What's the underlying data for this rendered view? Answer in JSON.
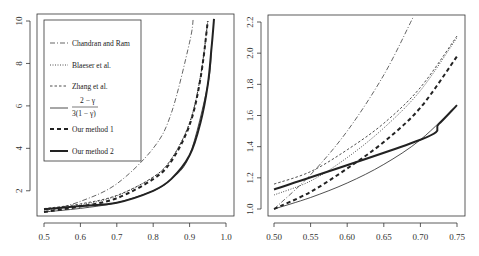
{
  "chart_data": [
    {
      "type": "line",
      "panel": "left",
      "title": "",
      "xlabel": "",
      "ylabel": "",
      "xlim": [
        0.5,
        1.0
      ],
      "ylim": [
        1.0,
        10.0
      ],
      "x_ticks": [
        0.5,
        0.6,
        0.7,
        0.8,
        0.9,
        1.0
      ],
      "x_tick_labels": [
        "0.5",
        "0.6",
        "0.7",
        "0.8",
        "0.9",
        "1.0"
      ],
      "y_ticks": [
        2,
        4,
        6,
        8,
        10
      ],
      "y_tick_labels": [
        "2",
        "4",
        "6",
        "8",
        "10"
      ],
      "grid": false,
      "legend_position": "top-left",
      "series": [
        {
          "name": "Chandran and Ram",
          "style": "dash-dot",
          "x": [
            0.5,
            0.6,
            0.7,
            0.8,
            0.85,
            0.9,
            0.91
          ],
          "y": [
            1.0,
            1.5,
            2.33,
            4.0,
            5.67,
            9.0,
            10.1
          ]
        },
        {
          "name": "Blaeser et al.",
          "style": "dotted",
          "x": [
            0.5,
            0.6,
            0.7,
            0.8,
            0.85,
            0.9,
            0.93,
            0.95
          ],
          "y": [
            1.09,
            1.33,
            1.76,
            2.64,
            3.5,
            5.2,
            7.4,
            10.0
          ]
        },
        {
          "name": "Zhang et al.",
          "style": "dashed-thin",
          "x": [
            0.5,
            0.6,
            0.7,
            0.8,
            0.85,
            0.9,
            0.93,
            0.95
          ],
          "y": [
            1.16,
            1.38,
            1.78,
            2.65,
            3.5,
            5.2,
            7.4,
            10.0
          ]
        },
        {
          "name": "(2-γ)/(3(1-γ))",
          "style": "solid-thin",
          "x": [
            0.5,
            0.6,
            0.7,
            0.8,
            0.85,
            0.9,
            0.95,
            0.96
          ],
          "y": [
            1.0,
            1.17,
            1.44,
            2.0,
            2.56,
            3.67,
            7.0,
            8.67
          ]
        },
        {
          "name": "Our method 1",
          "style": "dashed-thick",
          "x": [
            0.5,
            0.6,
            0.7,
            0.8,
            0.85,
            0.9,
            0.93,
            0.95
          ],
          "y": [
            1.0,
            1.26,
            1.65,
            2.55,
            3.4,
            5.1,
            7.3,
            10.0
          ]
        },
        {
          "name": "Our method 2",
          "style": "solid-thick",
          "x": [
            0.5,
            0.6,
            0.7,
            0.8,
            0.85,
            0.9,
            0.93,
            0.95,
            0.96,
            0.967
          ],
          "y": [
            1.125,
            1.28,
            1.44,
            2.0,
            2.56,
            3.67,
            5.22,
            7.0,
            8.67,
            10.1
          ]
        }
      ]
    },
    {
      "type": "line",
      "panel": "right",
      "title": "",
      "xlabel": "",
      "ylabel": "",
      "xlim": [
        0.5,
        0.75
      ],
      "ylim": [
        1.0,
        2.2
      ],
      "x_ticks": [
        0.5,
        0.55,
        0.6,
        0.65,
        0.7,
        0.75
      ],
      "x_tick_labels": [
        "0.50",
        "0.55",
        "0.60",
        "0.65",
        "0.70",
        "0.75"
      ],
      "y_ticks": [
        1.0,
        1.2,
        1.4,
        1.6,
        1.8,
        2.0,
        2.2
      ],
      "y_tick_labels": [
        "1.0",
        "1.2",
        "1.4",
        "1.6",
        "1.8",
        "2.0",
        "2.2"
      ],
      "grid": false,
      "legend_position": "none",
      "series": [
        {
          "name": "Chandran and Ram",
          "style": "dash-dot",
          "x": [
            0.5,
            0.55,
            0.6,
            0.65,
            0.69
          ],
          "y": [
            1.0,
            1.22,
            1.5,
            1.86,
            2.23
          ]
        },
        {
          "name": "Blaeser et al.",
          "style": "dotted",
          "x": [
            0.5,
            0.55,
            0.6,
            0.65,
            0.7,
            0.75
          ],
          "y": [
            1.09,
            1.18,
            1.33,
            1.52,
            1.76,
            2.1
          ]
        },
        {
          "name": "Zhang et al.",
          "style": "dashed-thin",
          "x": [
            0.5,
            0.55,
            0.6,
            0.65,
            0.7,
            0.75
          ],
          "y": [
            1.16,
            1.24,
            1.38,
            1.55,
            1.78,
            2.11
          ]
        },
        {
          "name": "(2-γ)/(3(1-γ))",
          "style": "solid-thin",
          "x": [
            0.5,
            0.55,
            0.6,
            0.65,
            0.7,
            0.75
          ],
          "y": [
            1.0,
            1.074,
            1.167,
            1.286,
            1.444,
            1.667
          ]
        },
        {
          "name": "Our method 1",
          "style": "dashed-thick",
          "x": [
            0.5,
            0.55,
            0.6,
            0.65,
            0.7,
            0.75
          ],
          "y": [
            1.0,
            1.11,
            1.26,
            1.43,
            1.65,
            1.98
          ]
        },
        {
          "name": "Our method 2",
          "style": "solid-thick",
          "x": [
            0.5,
            0.7,
            0.725,
            0.75
          ],
          "y": [
            1.125,
            1.444,
            1.545,
            1.667
          ]
        }
      ]
    }
  ],
  "legend": {
    "items": [
      {
        "label": "Chandran and Ram",
        "style": "dash-dot"
      },
      {
        "label": "Blaeser et al.",
        "style": "dotted"
      },
      {
        "label": "Zhang et al.",
        "style": "dashed-thin"
      },
      {
        "label_num": "2 − γ",
        "label_den": "3(1 − γ)",
        "style": "solid-thin"
      },
      {
        "label": "Our method 1",
        "style": "dashed-thick"
      },
      {
        "label": "Our method 2",
        "style": "solid-thick"
      }
    ]
  },
  "colors": {
    "line": "#222222",
    "axis": "#333333",
    "background": "#ffffff"
  }
}
